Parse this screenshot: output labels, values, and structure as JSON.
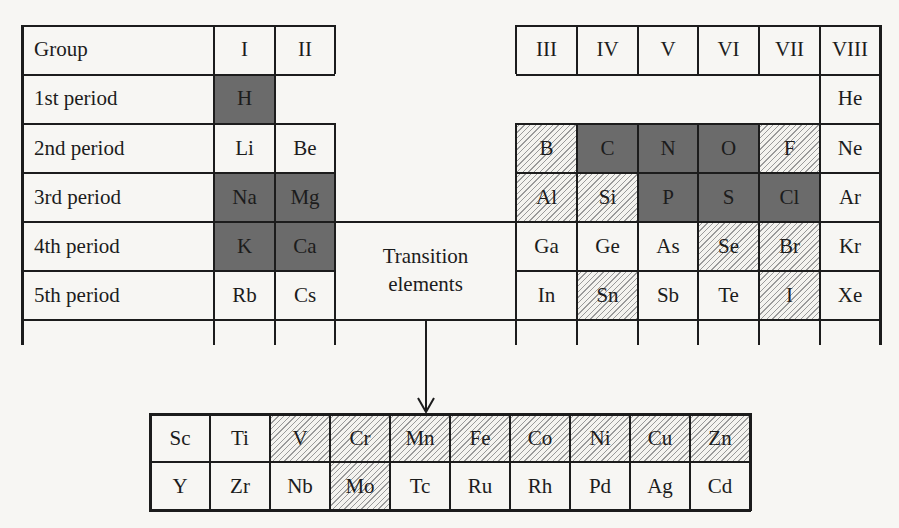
{
  "legend_note": "Dark = essential major elements; hatched = essential trace elements",
  "header": {
    "group_label": "Group",
    "groups_left": [
      "I",
      "II"
    ],
    "groups_right": [
      "III",
      "IV",
      "V",
      "VI",
      "VII",
      "VIII"
    ]
  },
  "periods": [
    "1st period",
    "2nd period",
    "3rd period",
    "4th period",
    "5th period"
  ],
  "left_block": [
    [
      {
        "s": "H",
        "t": "dark"
      },
      {
        "s": "",
        "t": "none"
      }
    ],
    [
      {
        "s": "Li",
        "t": "plain"
      },
      {
        "s": "Be",
        "t": "plain"
      }
    ],
    [
      {
        "s": "Na",
        "t": "dark"
      },
      {
        "s": "Mg",
        "t": "dark"
      }
    ],
    [
      {
        "s": "K",
        "t": "dark"
      },
      {
        "s": "Ca",
        "t": "dark"
      }
    ],
    [
      {
        "s": "Rb",
        "t": "plain"
      },
      {
        "s": "Cs",
        "t": "plain"
      }
    ]
  ],
  "right_block": [
    [
      {
        "s": "",
        "t": "none"
      },
      {
        "s": "",
        "t": "none"
      },
      {
        "s": "",
        "t": "none"
      },
      {
        "s": "",
        "t": "none"
      },
      {
        "s": "",
        "t": "none"
      },
      {
        "s": "He",
        "t": "plain"
      }
    ],
    [
      {
        "s": "B",
        "t": "hatch"
      },
      {
        "s": "C",
        "t": "dark"
      },
      {
        "s": "N",
        "t": "dark"
      },
      {
        "s": "O",
        "t": "dark"
      },
      {
        "s": "F",
        "t": "hatch"
      },
      {
        "s": "Ne",
        "t": "plain"
      }
    ],
    [
      {
        "s": "Al",
        "t": "hatch"
      },
      {
        "s": "Si",
        "t": "hatch"
      },
      {
        "s": "P",
        "t": "dark"
      },
      {
        "s": "S",
        "t": "dark"
      },
      {
        "s": "Cl",
        "t": "dark"
      },
      {
        "s": "Ar",
        "t": "plain"
      }
    ],
    [
      {
        "s": "Ga",
        "t": "plain"
      },
      {
        "s": "Ge",
        "t": "plain"
      },
      {
        "s": "As",
        "t": "plain"
      },
      {
        "s": "Se",
        "t": "hatch"
      },
      {
        "s": "Br",
        "t": "hatch"
      },
      {
        "s": "Kr",
        "t": "plain"
      }
    ],
    [
      {
        "s": "In",
        "t": "plain"
      },
      {
        "s": "Sn",
        "t": "hatch"
      },
      {
        "s": "Sb",
        "t": "plain"
      },
      {
        "s": "Te",
        "t": "plain"
      },
      {
        "s": "I",
        "t": "hatch"
      },
      {
        "s": "Xe",
        "t": "plain"
      }
    ]
  ],
  "transition_label": [
    "Transition",
    "elements"
  ],
  "transition_block": [
    [
      {
        "s": "Sc",
        "t": "plain"
      },
      {
        "s": "Ti",
        "t": "plain"
      },
      {
        "s": "V",
        "t": "hatch"
      },
      {
        "s": "Cr",
        "t": "hatch"
      },
      {
        "s": "Mn",
        "t": "hatch"
      },
      {
        "s": "Fe",
        "t": "hatch"
      },
      {
        "s": "Co",
        "t": "hatch"
      },
      {
        "s": "Ni",
        "t": "hatch"
      },
      {
        "s": "Cu",
        "t": "hatch"
      },
      {
        "s": "Zn",
        "t": "hatch"
      }
    ],
    [
      {
        "s": "Y",
        "t": "plain"
      },
      {
        "s": "Zr",
        "t": "plain"
      },
      {
        "s": "Nb",
        "t": "plain"
      },
      {
        "s": "Mo",
        "t": "hatch"
      },
      {
        "s": "Tc",
        "t": "plain"
      },
      {
        "s": "Ru",
        "t": "plain"
      },
      {
        "s": "Rh",
        "t": "plain"
      },
      {
        "s": "Pd",
        "t": "plain"
      },
      {
        "s": "Ag",
        "t": "plain"
      },
      {
        "s": "Cd",
        "t": "plain"
      }
    ]
  ],
  "colors": {
    "dark": "#6b6b6b",
    "line": "#1c1c1c",
    "paper": "#f7f6f3"
  }
}
